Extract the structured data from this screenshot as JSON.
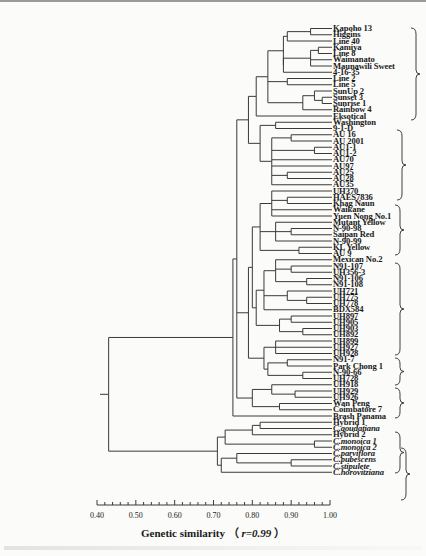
{
  "figure": {
    "xlabel": "Genetic similarity",
    "xlabel_stat": "r=0.99",
    "ticks": [
      "0.40",
      "0.50",
      "0.60",
      "0.70",
      "0.80",
      "0.90",
      "1.00"
    ]
  },
  "leaves": [
    "Kapoho 13",
    "Higgins",
    "Line 40",
    "Kamiya",
    "Line 8",
    "Waimanato",
    "Maunawili Sweet",
    "4-16-35",
    "Line 2",
    "Line 5",
    "SunUp 2",
    "Sunset 3",
    "Sunrise 1",
    "Rainbow 4",
    "Eksotical",
    "Washington",
    "9-1-D",
    "AU 16",
    "AU 2001",
    "AU1-1",
    "AU1-2",
    "AU70",
    "AU97",
    "AU25",
    "AU28",
    "AU35",
    "UH370",
    "HAES7836",
    "Khag Naun",
    "Waikane",
    "Yuen Nong No.1",
    "Mutant Yellow",
    "N-90-98",
    "Saipan Red",
    "N-90-99",
    "KL Yellow",
    "AU 9",
    "Mexican No.2",
    "N91-107",
    "UH356-3",
    "N91-106",
    "N91-108",
    "UH721",
    "UH775",
    "UH778",
    "BDX584",
    "UH897",
    "UH905",
    "UH903",
    "UH892",
    "UH899",
    "UH927",
    "UH928",
    "N91-7",
    "Park Chong 1",
    "N-90-66",
    "UH728",
    "UH918",
    "UH929",
    "UH926",
    "Wan Peng",
    "Coimbatore 7",
    "Brash Panama",
    "Hybrid 1",
    "C.goudatiana",
    "Hybrid 2",
    "C.monoica 1",
    "C.monoica 2",
    "C.parviflora",
    "C.pubescens",
    "C.stipulete",
    "C.horovitziana"
  ],
  "italic_leaves": [
    "C.goudatiana",
    "C.monoica 1",
    "C.monoica 2",
    "C.parviflora",
    "C.pubescens",
    "C.stipulete",
    "C.horovitziana"
  ],
  "chart_data": {
    "type": "dendrogram",
    "title": "",
    "xlabel": "Genetic similarity (r=0.99)",
    "ylabel": "",
    "xlim": [
      0.4,
      1.0
    ],
    "x_ticks": [
      0.4,
      0.5,
      0.6,
      0.7,
      0.8,
      0.9,
      1.0
    ],
    "cophenetic_correlation": 0.99,
    "leaf_count": 72,
    "groups": [
      {
        "id": 1,
        "members": [
          "Kapoho 13",
          "Higgins",
          "Line 40",
          "Kamiya",
          "Line 8",
          "Waimanato",
          "Maunawili Sweet",
          "4-16-35",
          "Line 2",
          "Line 5",
          "SunUp 2",
          "Sunset 3",
          "Sunrise 1",
          "Rainbow 4",
          "Eksotical"
        ]
      },
      {
        "id": 2,
        "members": [
          "Washington",
          "9-1-D",
          "AU 16",
          "AU 2001",
          "AU1-1",
          "AU1-2",
          "AU70",
          "AU97",
          "AU25",
          "AU28",
          "AU35"
        ]
      },
      {
        "id": 3,
        "members": [
          "UH370",
          "HAES7836",
          "Khag Naun",
          "Waikane",
          "Yuen Nong No.1",
          "Mutant Yellow",
          "N-90-98",
          "Saipan Red",
          "N-90-99",
          "KL Yellow",
          "AU 9"
        ]
      },
      {
        "id": 4,
        "members": [
          "Mexican No.2",
          "N91-107",
          "UH356-3",
          "N91-106",
          "N91-108",
          "UH721",
          "UH775",
          "UH778",
          "BDX584",
          "UH897",
          "UH905",
          "UH903",
          "UH892"
        ]
      },
      {
        "id": 5,
        "members": [
          "UH899",
          "UH927",
          "UH928"
        ]
      },
      {
        "id": 6,
        "members": [
          "N91-7",
          "Park Chong 1",
          "N-90-66",
          "UH728"
        ]
      },
      {
        "id": 7,
        "members": [
          "UH918",
          "UH929",
          "UH926",
          "Wan Peng",
          "Coimbatore 7"
        ]
      },
      {
        "id": 8,
        "members": [
          "Hybrid 1",
          "C.goudatiana",
          "Hybrid 2",
          "C.monoica 1",
          "C.monoica 2",
          "C.parviflora",
          "C.pubescens",
          "C.stipulete",
          "C.horovitziana"
        ]
      }
    ],
    "key_merge_levels": {
      "root (Carica papaya vs wild Vasconcellea)": 0.43,
      "C. papaya cultivars incl. Brash Panama": 0.75,
      "wild species + hybrids clade": 0.71,
      "Hybrid 1 / C.goudatiana / Hybrid 2 subclade": 0.8,
      "C.monoica 1 / C.monoica 2": 0.96
    }
  }
}
